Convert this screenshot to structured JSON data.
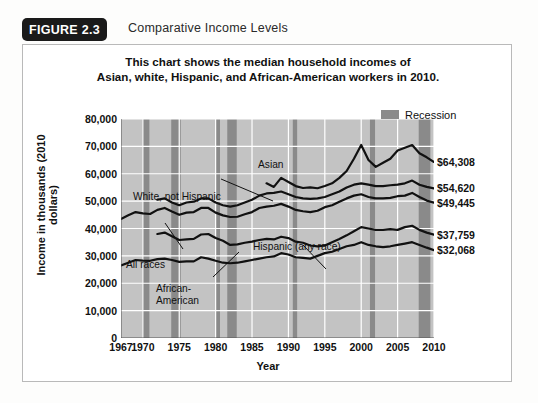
{
  "figure": {
    "badge": "FIGURE 2.3",
    "title": "Comparative Income Levels"
  },
  "chart_data": {
    "type": "line",
    "title": "This chart shows the median household incomes of\nAsian, white, Hispanic, and African-American workers in 2010.",
    "title_line1": "This chart shows the median household incomes of",
    "title_line2": "Asian, white, Hispanic, and African-American workers in 2010.",
    "xlabel": "Year",
    "ylabel": "Income in thousands (2010 dollars)",
    "xlim": [
      1967,
      2010
    ],
    "ylim": [
      0,
      80000
    ],
    "grid": true,
    "legend_position": "top-right",
    "legend": [
      {
        "label": "Recession",
        "color": "#8a8a8a"
      }
    ],
    "plot_background": "#c3c3c3",
    "gridline_color": "#ffffff",
    "line_color": "#111111",
    "xticks": [
      1967,
      1970,
      1975,
      1980,
      1985,
      1990,
      1995,
      2000,
      2005,
      2010
    ],
    "yticks": [
      0,
      10000,
      20000,
      30000,
      40000,
      50000,
      60000,
      70000,
      80000
    ],
    "ytick_labels": [
      "0",
      "10,000",
      "20,000",
      "30,000",
      "40,000",
      "50,000",
      "60,000",
      "70,000",
      "80,000"
    ],
    "recessions": [
      {
        "start": 1969.9,
        "end": 1970.9
      },
      {
        "start": 1973.9,
        "end": 1975.2
      },
      {
        "start": 1980.0,
        "end": 1980.6
      },
      {
        "start": 1981.6,
        "end": 1982.9
      },
      {
        "start": 1990.6,
        "end": 1991.2
      },
      {
        "start": 2001.2,
        "end": 2001.9
      },
      {
        "start": 2007.9,
        "end": 2009.5
      }
    ],
    "series": [
      {
        "name": "Asian",
        "annotation": "Asian",
        "end_value": 64308,
        "end_label": "$64,308",
        "x": [
          1987,
          1988,
          1989,
          1990,
          1991,
          1992,
          1993,
          1994,
          1995,
          1996,
          1997,
          1998,
          1999,
          2000,
          2001,
          2002,
          2003,
          2004,
          2005,
          2006,
          2007,
          2008,
          2009,
          2010
        ],
        "y": [
          56500,
          55200,
          58500,
          57000,
          55500,
          54800,
          55000,
          54700,
          55500,
          56500,
          58500,
          61000,
          65500,
          70500,
          65000,
          62500,
          64000,
          65500,
          68500,
          69500,
          70500,
          67500,
          66000,
          64308
        ]
      },
      {
        "name": "White, not Hispanic",
        "annotation": "White, not Hispanic",
        "end_value": 54620,
        "end_label": "$54,620",
        "x": [
          1972,
          1973,
          1974,
          1975,
          1976,
          1977,
          1978,
          1979,
          1980,
          1981,
          1982,
          1983,
          1984,
          1985,
          1986,
          1987,
          1988,
          1989,
          1990,
          1991,
          1992,
          1993,
          1994,
          1995,
          1996,
          1997,
          1998,
          1999,
          2000,
          2001,
          2002,
          2003,
          2004,
          2005,
          2006,
          2007,
          2008,
          2009,
          2010
        ],
        "y": [
          50500,
          51000,
          49500,
          48500,
          49500,
          49800,
          51000,
          51000,
          49500,
          48500,
          48000,
          48500,
          49500,
          50500,
          52000,
          52800,
          53000,
          53500,
          52500,
          51500,
          51000,
          50800,
          51000,
          51500,
          52500,
          53500,
          55000,
          56000,
          56500,
          56000,
          55500,
          55500,
          55800,
          56000,
          56500,
          57500,
          56000,
          55200,
          54620
        ]
      },
      {
        "name": "All races",
        "annotation": "All races",
        "end_value": 49445,
        "end_label": "$49,445",
        "x": [
          1967,
          1968,
          1969,
          1970,
          1971,
          1972,
          1973,
          1974,
          1975,
          1976,
          1977,
          1978,
          1979,
          1980,
          1981,
          1982,
          1983,
          1984,
          1985,
          1986,
          1987,
          1988,
          1989,
          1990,
          1991,
          1992,
          1993,
          1994,
          1995,
          1996,
          1997,
          1998,
          1999,
          2000,
          2001,
          2002,
          2003,
          2004,
          2005,
          2006,
          2007,
          2008,
          2009,
          2010
        ],
        "y": [
          43500,
          44800,
          46000,
          45500,
          45300,
          46800,
          47500,
          46200,
          45000,
          45800,
          46000,
          47500,
          47500,
          45800,
          44800,
          44200,
          44300,
          45200,
          46000,
          47500,
          48000,
          48300,
          49000,
          48000,
          46800,
          46300,
          46000,
          46500,
          47800,
          48500,
          49800,
          51000,
          52000,
          52500,
          51500,
          51000,
          51000,
          51200,
          51800,
          52000,
          53000,
          51500,
          50200,
          49445
        ]
      },
      {
        "name": "Hispanic (any race)",
        "annotation": "Hispanic (any race)",
        "end_value": 37759,
        "end_label": "$37,759",
        "x": [
          1972,
          1973,
          1974,
          1975,
          1976,
          1977,
          1978,
          1979,
          1980,
          1981,
          1982,
          1983,
          1984,
          1985,
          1986,
          1987,
          1988,
          1989,
          1990,
          1991,
          1992,
          1993,
          1994,
          1995,
          1996,
          1997,
          1998,
          1999,
          2000,
          2001,
          2002,
          2003,
          2004,
          2005,
          2006,
          2007,
          2008,
          2009,
          2010
        ],
        "y": [
          38000,
          38500,
          37200,
          35800,
          36000,
          36200,
          37800,
          38000,
          36500,
          35500,
          34000,
          34200,
          34800,
          35200,
          35800,
          36200,
          36000,
          37000,
          36500,
          35200,
          34800,
          33800,
          33500,
          33800,
          35000,
          36200,
          37500,
          39000,
          40500,
          40000,
          39500,
          39500,
          39800,
          39500,
          40500,
          41000,
          39500,
          38500,
          37759
        ]
      },
      {
        "name": "African-American",
        "annotation": "African-\nAmerican",
        "annotation_line1": "African-",
        "annotation_line2": "American",
        "end_value": 32068,
        "end_label": "$32,068",
        "x": [
          1967,
          1968,
          1969,
          1970,
          1971,
          1972,
          1973,
          1974,
          1975,
          1976,
          1977,
          1978,
          1979,
          1980,
          1981,
          1982,
          1983,
          1984,
          1985,
          1986,
          1987,
          1988,
          1989,
          1990,
          1991,
          1992,
          1993,
          1994,
          1995,
          1996,
          1997,
          1998,
          1999,
          2000,
          2001,
          2002,
          2003,
          2004,
          2005,
          2006,
          2007,
          2008,
          2009,
          2010
        ],
        "y": [
          26500,
          27500,
          28500,
          28300,
          28200,
          28800,
          29000,
          28500,
          27800,
          28000,
          28000,
          29500,
          29000,
          28200,
          27500,
          27300,
          27500,
          28000,
          28500,
          29000,
          29500,
          29800,
          31000,
          30500,
          29500,
          29300,
          29000,
          30000,
          31000,
          31500,
          32500,
          33500,
          34000,
          35000,
          34000,
          33500,
          33200,
          33500,
          34000,
          34500,
          35000,
          34000,
          33000,
          32068
        ]
      }
    ],
    "annotations": [
      {
        "text": "White, not Hispanic",
        "leader": true
      },
      {
        "text": "All races",
        "leader": true
      },
      {
        "text": "Hispanic (any race)",
        "leader": true
      },
      {
        "text": "African-American",
        "leader": true
      },
      {
        "text": "Asian",
        "leader": false
      }
    ]
  }
}
